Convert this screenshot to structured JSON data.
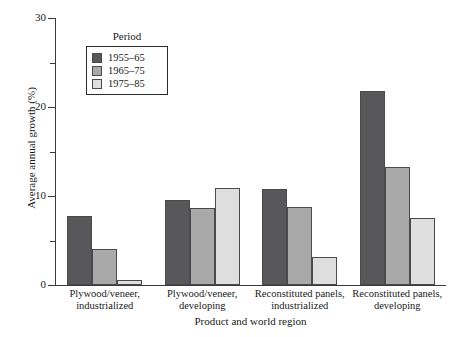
{
  "chart_data": {
    "type": "bar",
    "title": "",
    "xlabel": "Product and world region",
    "ylabel": "Average annual growth (%)",
    "ylim": [
      0,
      30
    ],
    "ytick_labels": [
      "0",
      "10",
      "20",
      "30"
    ],
    "ytick_values": [
      0,
      10,
      20,
      30
    ],
    "yminor_values": [
      5,
      15,
      25
    ],
    "grid": false,
    "legend_position": "top-left-inside",
    "legend_title": "Period",
    "categories": [
      "Plywood/veneer, industrialized",
      "Plywood/veneer, developing",
      "Reconstituted panels, industrialized",
      "Reconstituted panels, developing"
    ],
    "category_lines": [
      [
        "Plywood/veneer,",
        "industrialized"
      ],
      [
        "Plywood/veneer,",
        "developing"
      ],
      [
        "Reconstituted panels,",
        "industrialized"
      ],
      [
        "Reconstituted panels,",
        "developing"
      ]
    ],
    "series": [
      {
        "name": "1955–65",
        "color": "#58585a",
        "values": [
          7.8,
          9.5,
          10.8,
          21.8
        ]
      },
      {
        "name": "1965–75",
        "color": "#a9a9a9",
        "values": [
          4.0,
          8.6,
          8.8,
          13.3
        ]
      },
      {
        "name": "1975–85",
        "color": "#dedede",
        "values": [
          0.6,
          10.9,
          3.1,
          7.5
        ]
      }
    ]
  },
  "axis": {
    "y_title": "Average annual growth (%)",
    "x_title": "Product and world region"
  },
  "legend": {
    "title": "Period",
    "items": [
      {
        "label": "1955–65"
      },
      {
        "label": "1965–75"
      },
      {
        "label": "1975–85"
      }
    ]
  }
}
